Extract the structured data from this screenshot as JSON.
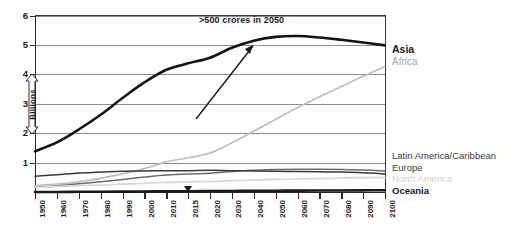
{
  "chart_data": {
    "type": "line",
    "title": "",
    "subtitle": "",
    "xlabel": "",
    "ylabel": "Billions",
    "ylim": [
      0,
      6
    ],
    "yticks": [
      1,
      2,
      3,
      4,
      5,
      6
    ],
    "grid": true,
    "legend_position": "right-inline",
    "x": [
      1950,
      1960,
      1970,
      1980,
      1990,
      2000,
      2010,
      2015,
      2020,
      2030,
      2040,
      2050,
      2060,
      2070,
      2080,
      2090,
      2100
    ],
    "xtick_labels": [
      "1950",
      "1960",
      "1970",
      "1980",
      "1990",
      "2000",
      "2010",
      "2015",
      "2020",
      "2030",
      "2040",
      "2050",
      "2060",
      "2070",
      "2080",
      "2090",
      "2100"
    ],
    "annotations": [
      {
        "text": ">500 crores in 2050",
        "target_series": "Asia",
        "target_x": 2040,
        "target_y": 5.2
      }
    ],
    "series": [
      {
        "name": "Asia",
        "color": "#141414",
        "emphasis": "bold",
        "values": [
          1.4,
          1.7,
          2.14,
          2.64,
          3.21,
          3.74,
          4.17,
          4.39,
          4.58,
          4.92,
          5.16,
          5.29,
          5.32,
          5.27,
          5.19,
          5.1,
          5.0
        ]
      },
      {
        "name": "Africa",
        "color": "#bdbdbd",
        "emphasis": "light",
        "values": [
          0.23,
          0.28,
          0.36,
          0.48,
          0.63,
          0.81,
          1.04,
          1.18,
          1.34,
          1.69,
          2.08,
          2.49,
          2.88,
          3.25,
          3.6,
          3.95,
          4.28
        ]
      },
      {
        "name": "Latin America/Caribbean",
        "color": "#6b6b6b",
        "emphasis": "medium",
        "values": [
          0.17,
          0.22,
          0.29,
          0.36,
          0.44,
          0.52,
          0.59,
          0.63,
          0.65,
          0.71,
          0.75,
          0.78,
          0.79,
          0.79,
          0.78,
          0.76,
          0.73
        ]
      },
      {
        "name": "Europe",
        "color": "#3a3a3a",
        "emphasis": "medium",
        "values": [
          0.55,
          0.6,
          0.66,
          0.69,
          0.72,
          0.73,
          0.74,
          0.74,
          0.75,
          0.74,
          0.73,
          0.72,
          0.71,
          0.7,
          0.69,
          0.67,
          0.63
        ]
      },
      {
        "name": "North America",
        "color": "#d8d8d8",
        "emphasis": "light",
        "values": [
          0.17,
          0.2,
          0.23,
          0.25,
          0.28,
          0.31,
          0.34,
          0.36,
          0.37,
          0.4,
          0.42,
          0.44,
          0.46,
          0.47,
          0.49,
          0.5,
          0.5
        ]
      },
      {
        "name": "Oceania",
        "color": "#1a1a1a",
        "emphasis": "bold",
        "values": [
          0.013,
          0.016,
          0.02,
          0.023,
          0.027,
          0.031,
          0.037,
          0.039,
          0.043,
          0.048,
          0.053,
          0.057,
          0.061,
          0.064,
          0.067,
          0.07,
          0.072
        ]
      }
    ]
  },
  "axis": {
    "y_label": "Billions",
    "y_ticks": [
      "6",
      "5",
      "4",
      "3",
      "2",
      "1"
    ],
    "x_ticks": [
      "1950",
      "1960",
      "1970",
      "1980",
      "1990",
      "2000",
      "2010",
      "2015",
      "2020",
      "2030",
      "2040",
      "2050",
      "2060",
      "2070",
      "2080",
      "2090",
      "2100"
    ]
  },
  "series_labels": {
    "asia": "Asia",
    "africa": "Africa",
    "latin_america": "Latin America/Caribbean",
    "europe": "Europe",
    "north_america": "North America",
    "oceania": "Oceania"
  },
  "annotation": {
    "text": ">500 crores in 2050"
  }
}
